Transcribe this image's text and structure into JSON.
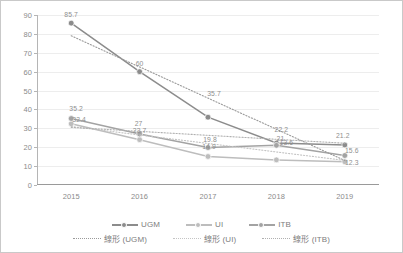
{
  "chart_data": {
    "type": "line",
    "title": "",
    "subtitle": "",
    "xlabel": "",
    "ylabel": "",
    "categories": [
      "2015",
      "2016",
      "2017",
      "2018",
      "2019"
    ],
    "x": [
      2015,
      2016,
      2017,
      2018,
      2019
    ],
    "ylim": [
      0,
      90
    ],
    "ytick_step": 10,
    "yticks": [
      "0",
      "10",
      "20",
      "30",
      "40",
      "50",
      "60",
      "70",
      "80",
      "90"
    ],
    "grid": true,
    "grid_axis": "y",
    "legend_position": "bottom",
    "series": [
      {
        "name": "UGM",
        "color": "#8c8c8c",
        "style": "solid",
        "marker": "circle",
        "values": [
          85.7,
          60,
          35.9,
          22.2,
          21.2
        ],
        "point_labels": [
          "85.7",
          "60",
          "",
          "22.2",
          "21.2"
        ]
      },
      {
        "name": "UI",
        "color": "#bdbdbd",
        "style": "solid",
        "marker": "circle",
        "values": [
          32.4,
          24.0,
          15.1,
          13.3,
          12.3
        ],
        "point_labels": [
          "32.4",
          "",
          "",
          "",
          "12.3"
        ]
      },
      {
        "name": "ITB",
        "color": "#a3a3a3",
        "style": "solid",
        "marker": "circle",
        "values": [
          35.2,
          27.0,
          19.8,
          21.0,
          15.6
        ],
        "point_labels": [
          "35.2",
          "27",
          "19.8",
          "21",
          "15.6"
        ]
      },
      {
        "name": "線形 (UGM)",
        "color": "#9a9a9a",
        "style": "dotted",
        "marker": "none",
        "values": [
          79.0,
          62.5,
          46.0,
          29.5,
          13.0
        ],
        "point_labels": [
          "",
          "",
          "35.7",
          "",
          ""
        ]
      },
      {
        "name": "線形 (UI)",
        "color": "#c4c4c4",
        "style": "dotted",
        "marker": "none",
        "values": [
          31.0,
          26.5,
          22.0,
          17.5,
          13.0
        ],
        "point_labels": [
          "",
          "23.7",
          "",
          "",
          ""
        ]
      },
      {
        "name": "線形 (ITB)",
        "color": "#b0b0b0",
        "style": "dotted",
        "marker": "none",
        "values": [
          30.5,
          28.4,
          26.3,
          24.2,
          22.1
        ],
        "point_labels": [
          "",
          "",
          "",
          "",
          ""
        ]
      }
    ],
    "annotations": [
      {
        "text": "85.7",
        "x": 2015,
        "y": 85.7,
        "dx": 0,
        "dy": -9
      },
      {
        "text": "35.2",
        "x": 2015,
        "y": 35.2,
        "dx": 5,
        "dy": -11
      },
      {
        "text": "32.4",
        "x": 2015,
        "y": 32.4,
        "dx": 8,
        "dy": -5
      },
      {
        "text": "60",
        "x": 2016,
        "y": 60,
        "dx": 0,
        "dy": -9
      },
      {
        "text": "27",
        "x": 2016,
        "y": 27,
        "dx": -1,
        "dy": -11
      },
      {
        "text": "23.7",
        "x": 2016,
        "y": 27,
        "dx": 0,
        "dy": -4
      },
      {
        "text": "35.7",
        "x": 2017,
        "y": 46,
        "dx": 6,
        "dy": -5
      },
      {
        "text": "19.8",
        "x": 2017,
        "y": 19.8,
        "dx": 2,
        "dy": -9
      },
      {
        "text": "14.9",
        "x": 2017,
        "y": 19.8,
        "dx": 1,
        "dy": -2
      },
      {
        "text": "22.2",
        "x": 2018,
        "y": 22.2,
        "dx": 5,
        "dy": -14
      },
      {
        "text": "21",
        "x": 2018,
        "y": 21,
        "dx": 4,
        "dy": -7
      },
      {
        "text": "13.6",
        "x": 2018,
        "y": 22.2,
        "dx": 10,
        "dy": -1
      },
      {
        "text": "21.2",
        "x": 2019,
        "y": 21.2,
        "dx": -2,
        "dy": -10
      },
      {
        "text": "15.6",
        "x": 2019,
        "y": 15.6,
        "dx": 7,
        "dy": -6
      },
      {
        "text": "12.3",
        "x": 2019,
        "y": 12.3,
        "dx": 7,
        "dy": 0
      }
    ]
  },
  "legend": {
    "row1": [
      {
        "label": "UGM",
        "color": "#8c8c8c",
        "style": "solid"
      },
      {
        "label": "UI",
        "color": "#bdbdbd",
        "style": "solid"
      },
      {
        "label": "ITB",
        "color": "#a3a3a3",
        "style": "solid"
      }
    ],
    "row2": [
      {
        "label": "線形 (UGM)",
        "color": "#9a9a9a",
        "style": "dotted"
      },
      {
        "label": "線形 (UI)",
        "color": "#c4c4c4",
        "style": "dotted"
      },
      {
        "label": "線形 (ITB)",
        "color": "#b0b0b0",
        "style": "dotted"
      }
    ]
  }
}
